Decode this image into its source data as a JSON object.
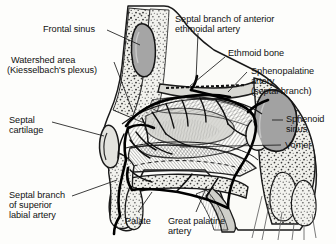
{
  "figure": {
    "background_color": "#fdfdfb",
    "ink_color": "#111111",
    "artery_color": "#000000",
    "cartilage_fill": "#b9b9b9",
    "sinus_fill": "#9a9a9a",
    "bone_fill": "#e8e8e4"
  },
  "labels": {
    "frontal_sinus": "Frontal sinus",
    "watershed_line1": "Watershed area",
    "watershed_line2": "(Kiesselbach's plexus)",
    "septal_cartilage_line1": "Septal",
    "septal_cartilage_line2": "cartilage",
    "septal_branch_superior_line1": "Septal branch",
    "septal_branch_superior_line2": "of superior",
    "septal_branch_superior_line3": "labial artery",
    "anterior_ethmoidal_line1": "Septal branch of anterior",
    "anterior_ethmoidal_line2": "ethmoidal artery",
    "ethmoid_bone": "Ethmoid bone",
    "sphenopalatine_line1": "Sphenopalatine",
    "sphenopalatine_line2": "artery",
    "sphenopalatine_line3": "(septal branch)",
    "sphenoid_sinus_line1": "Sphenoid",
    "sphenoid_sinus_line2": "sinus",
    "vomer": "Vomer",
    "palate": "Palate",
    "great_palatine_line1": "Great palatine",
    "great_palatine_line2": "artery"
  },
  "anatomy_structures": [
    "Frontal sinus",
    "Watershed area (Kiesselbach's plexus)",
    "Septal cartilage",
    "Septal branch of superior labial artery",
    "Septal branch of anterior ethmoidal artery",
    "Ethmoid bone",
    "Sphenopalatine artery (septal branch)",
    "Sphenoid sinus",
    "Vomer",
    "Palate",
    "Great palatine artery"
  ]
}
